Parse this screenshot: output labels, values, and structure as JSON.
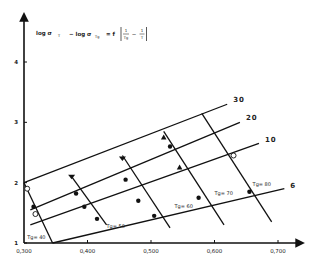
{
  "chart_data": {
    "type": "line",
    "formula": {
      "part1": "log σ",
      "sub1": "T",
      "part2": "− log σ",
      "sub2": "Tg",
      "part3": "= f",
      "frac1_num": "1",
      "frac1_den": "Tg",
      "minus": "−",
      "frac2_num": "1",
      "frac2_den": "T"
    },
    "xlabel": "",
    "ylabel": "",
    "xlim": [
      0.3,
      0.72
    ],
    "ylim": [
      1,
      4.5
    ],
    "x_ticks": [
      {
        "value": 0.3,
        "label": "0,300"
      },
      {
        "value": 0.4,
        "label": "0,400"
      },
      {
        "value": 0.5,
        "label": "0,500"
      },
      {
        "value": 0.6,
        "label": "0,600"
      },
      {
        "value": 0.7,
        "label": "0,700"
      }
    ],
    "y_ticks": [
      {
        "value": 1,
        "label": "1"
      },
      {
        "value": 2,
        "label": "2"
      },
      {
        "value": 3,
        "label": "3"
      },
      {
        "value": 4,
        "label": "4"
      }
    ],
    "grid": false,
    "series_shallow": [
      {
        "name": "30",
        "label": "30",
        "points": [
          [
            0.3,
            2.0
          ],
          [
            0.62,
            3.3
          ]
        ]
      },
      {
        "name": "20",
        "label": "20",
        "points": [
          [
            0.31,
            1.55
          ],
          [
            0.64,
            3.0
          ]
        ]
      },
      {
        "name": "10",
        "label": "10",
        "points": [
          [
            0.31,
            1.3
          ],
          [
            0.67,
            2.65
          ]
        ]
      },
      {
        "name": "6",
        "label": "6",
        "points": [
          [
            0.345,
            1.0
          ],
          [
            0.71,
            1.9
          ]
        ]
      }
    ],
    "series_steep": [
      {
        "name": "Tg=40",
        "label": "Tg=40",
        "points": [
          [
            0.3,
            2.0
          ],
          [
            0.345,
            1.0
          ]
        ]
      },
      {
        "name": "Tg=50",
        "label": "Tg=50",
        "points": [
          [
            0.375,
            2.1
          ],
          [
            0.43,
            1.3
          ]
        ]
      },
      {
        "name": "Tg=60",
        "label": "Tg=60",
        "points": [
          [
            0.455,
            2.45
          ],
          [
            0.53,
            1.25
          ]
        ]
      },
      {
        "name": "Tg=70",
        "label": "Tg=70",
        "points": [
          [
            0.52,
            2.85
          ],
          [
            0.615,
            1.3
          ]
        ]
      },
      {
        "name": "Tg=80",
        "label": "Tg=80",
        "points": [
          [
            0.58,
            3.15
          ],
          [
            0.69,
            1.35
          ]
        ]
      }
    ],
    "markers": [
      {
        "shape": "circle-open",
        "x": 0.305,
        "y": 1.9
      },
      {
        "shape": "circle-open",
        "x": 0.318,
        "y": 1.48
      },
      {
        "shape": "dot",
        "x": 0.315,
        "y": 1.6
      },
      {
        "shape": "triangle-down",
        "x": 0.375,
        "y": 2.1
      },
      {
        "shape": "dot",
        "x": 0.382,
        "y": 1.82
      },
      {
        "shape": "dot",
        "x": 0.395,
        "y": 1.6
      },
      {
        "shape": "dot",
        "x": 0.415,
        "y": 1.4
      },
      {
        "shape": "triangle-down",
        "x": 0.455,
        "y": 2.4
      },
      {
        "shape": "dot",
        "x": 0.46,
        "y": 2.05
      },
      {
        "shape": "dot",
        "x": 0.48,
        "y": 1.7
      },
      {
        "shape": "dot",
        "x": 0.505,
        "y": 1.45
      },
      {
        "shape": "triangle",
        "x": 0.52,
        "y": 2.75
      },
      {
        "shape": "dot",
        "x": 0.53,
        "y": 2.6
      },
      {
        "shape": "triangle",
        "x": 0.545,
        "y": 2.25
      },
      {
        "shape": "dot",
        "x": 0.575,
        "y": 1.75
      },
      {
        "shape": "circle-open",
        "x": 0.63,
        "y": 2.45
      },
      {
        "shape": "dot",
        "x": 0.655,
        "y": 1.85
      }
    ],
    "tg_labels": [
      {
        "text": "Tg= 40",
        "x": 0.305,
        "y": 1.06
      },
      {
        "text": "Tg= 50",
        "x": 0.43,
        "y": 1.25
      },
      {
        "text": "Tg= 60",
        "x": 0.537,
        "y": 1.58
      },
      {
        "text": "Tg= 70",
        "x": 0.6,
        "y": 1.8
      },
      {
        "text": "Tg= 80",
        "x": 0.66,
        "y": 1.95
      }
    ]
  }
}
